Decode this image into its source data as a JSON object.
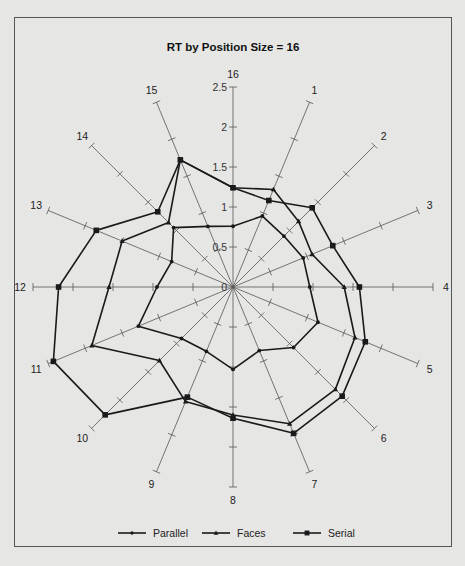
{
  "chart_data": {
    "type": "radar",
    "title": "RT by Position Size = 16",
    "axes": [
      "16",
      "1",
      "2",
      "3",
      "4",
      "5",
      "6",
      "7",
      "8",
      "9",
      "10",
      "11",
      "12",
      "13",
      "14",
      "15"
    ],
    "radial_ticks": [
      "0",
      "0.5",
      "1",
      "1.5",
      "2",
      "2.5"
    ],
    "rlim": [
      0,
      2.5
    ],
    "grid": false,
    "legend_position": "bottom",
    "series": [
      {
        "name": "Parallel",
        "marker": "circle",
        "values": [
          0.76,
          0.96,
          0.9,
          0.95,
          0.96,
          1.15,
          1.07,
          0.86,
          1.03,
          0.87,
          0.91,
          1.28,
          0.95,
          0.83,
          1.05,
          0.82
        ]
      },
      {
        "name": "Faces",
        "marker": "triangle",
        "values": [
          1.24,
          1.32,
          1.16,
          1.07,
          1.39,
          1.65,
          1.81,
          1.85,
          1.6,
          1.55,
          1.3,
          1.91,
          1.55,
          1.5,
          1.14,
          1.72
        ]
      },
      {
        "name": "Serial",
        "marker": "square",
        "values": [
          1.24,
          1.17,
          1.4,
          1.35,
          1.58,
          1.79,
          1.93,
          1.98,
          1.64,
          1.49,
          2.26,
          2.43,
          2.18,
          1.85,
          1.33,
          1.72
        ]
      }
    ]
  },
  "colors": {
    "line": "#1a1a1a",
    "axis": "#555555",
    "background": "#e6e6e4"
  }
}
